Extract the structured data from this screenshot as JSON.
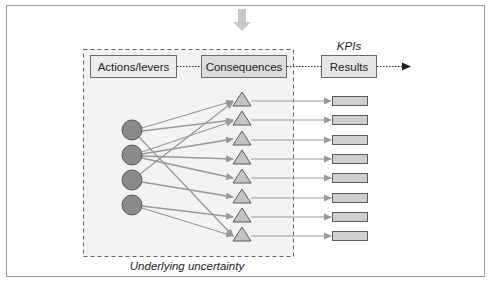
{
  "diagram": {
    "top_arrow": {
      "icon": "arrow-down-icon",
      "color": "#c8c8c8"
    },
    "uncertainty_region": {
      "label": "Underlying uncertainty",
      "fill": "#f2f2f2",
      "border": "#666666"
    },
    "header_boxes": [
      {
        "id": "actions",
        "label": "Actions/levers",
        "fill": "#ececec"
      },
      {
        "id": "consequences",
        "label": "Consequences",
        "fill": "#dcdcdc"
      },
      {
        "id": "results",
        "label": "Results",
        "fill": "#e6e6e6",
        "caption": "KPIs"
      }
    ],
    "nodes": {
      "circles": [
        {
          "id": "c1",
          "cx": 132,
          "cy": 130
        },
        {
          "id": "c2",
          "cx": 132,
          "cy": 155
        },
        {
          "id": "c3",
          "cx": 132,
          "cy": 180
        },
        {
          "id": "c4",
          "cx": 132,
          "cy": 205
        }
      ],
      "triangles": [
        {
          "id": "t1",
          "cy": 101
        },
        {
          "id": "t2",
          "cy": 120
        },
        {
          "id": "t3",
          "cy": 139
        },
        {
          "id": "t4",
          "cy": 159
        },
        {
          "id": "t5",
          "cy": 178
        },
        {
          "id": "t6",
          "cy": 197
        },
        {
          "id": "t7",
          "cy": 217
        },
        {
          "id": "t8",
          "cy": 236
        }
      ],
      "result_bars_count": 8
    },
    "edges": [
      [
        "c1",
        "t1"
      ],
      [
        "c1",
        "t2"
      ],
      [
        "c1",
        "t8"
      ],
      [
        "c2",
        "t2"
      ],
      [
        "c2",
        "t3"
      ],
      [
        "c2",
        "t4"
      ],
      [
        "c2",
        "t5"
      ],
      [
        "c3",
        "t1"
      ],
      [
        "c3",
        "t6"
      ],
      [
        "c4",
        "t7"
      ],
      [
        "c4",
        "t8"
      ]
    ],
    "colors": {
      "circle_fill": "#8a8a8a",
      "circle_stroke": "#5a5a5a",
      "triangle_fill": "#c4c4c4",
      "triangle_stroke": "#5a5a5a",
      "bar_fill": "#cfcfcf",
      "bar_stroke": "#5a5a5a",
      "edge": "#999999",
      "dotted": "#333333"
    }
  }
}
